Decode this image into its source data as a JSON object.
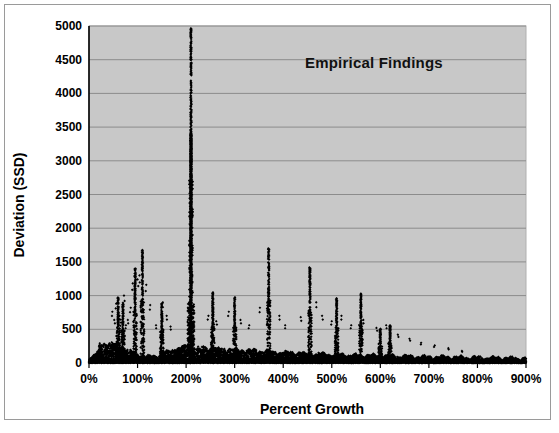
{
  "figure": {
    "background_color": "#ffffff",
    "border_color": "#9a9a9a"
  },
  "chart_data": {
    "type": "scatter",
    "title": "Empirical Findings",
    "subtitle": "",
    "xlabel": "Percent Growth",
    "ylabel": "Deviation (SSD)",
    "xlim": [
      0,
      900
    ],
    "ylim": [
      0,
      5000
    ],
    "x_tick_labels": [
      "0%",
      "100%",
      "200%",
      "300%",
      "400%",
      "500%",
      "600%",
      "700%",
      "800%",
      "900%"
    ],
    "x_tick_values": [
      0,
      100,
      200,
      300,
      400,
      500,
      600,
      700,
      800,
      900
    ],
    "y_tick_labels": [
      "0",
      "500",
      "1000",
      "1500",
      "2000",
      "2500",
      "3000",
      "3500",
      "4000",
      "4500",
      "5000"
    ],
    "y_tick_values": [
      0,
      500,
      1000,
      1500,
      2000,
      2500,
      3000,
      3500,
      4000,
      4500,
      5000
    ],
    "grid": "horizontal",
    "legend": "none",
    "plot_background_color": "#c8c8c8",
    "gridline_color": "#8c8c8c",
    "marker_color": "#000000",
    "marker_shape": "diamond",
    "marker_size": 2,
    "annotations": [
      {
        "text": "Empirical Findings",
        "x": 440,
        "y": 4300
      }
    ],
    "spikes": [
      {
        "x": 210,
        "peak": 4950
      },
      {
        "x": 110,
        "peak": 1700
      },
      {
        "x": 370,
        "peak": 1700
      },
      {
        "x": 95,
        "peak": 1400
      },
      {
        "x": 455,
        "peak": 1420
      },
      {
        "x": 255,
        "peak": 1050
      },
      {
        "x": 300,
        "peak": 1000
      },
      {
        "x": 510,
        "peak": 960
      },
      {
        "x": 560,
        "peak": 1030
      },
      {
        "x": 150,
        "peak": 900
      },
      {
        "x": 60,
        "peak": 980
      },
      {
        "x": 70,
        "peak": 900
      },
      {
        "x": 600,
        "peak": 520
      },
      {
        "x": 620,
        "peak": 560
      }
    ],
    "series": [
      {
        "name": "Deviation (SSD)",
        "marker": "diamond",
        "color": "#000000",
        "note": "approximately 20000 plotted points forming baseline band plus spikes"
      }
    ]
  }
}
